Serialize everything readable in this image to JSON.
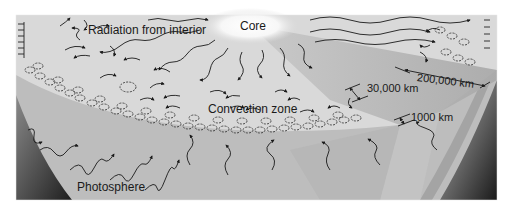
{
  "figure": {
    "labels": {
      "core": "Core",
      "radiation": "Radiation from interior",
      "convection": "Convection zone",
      "photosphere": "Photosphere"
    },
    "dimensions": {
      "radiative_depth": "200,000 km",
      "convection_depth": "30,000 km",
      "photosphere_depth": "1000 km"
    },
    "colors": {
      "background": "#ffffff",
      "interior_light": "#dcdcdc",
      "core_glow": "#f7f7f7",
      "wedge_mid": "#b9b9b9",
      "photosphere": "#a9a9a9",
      "edge_dark": "#3a3a3a",
      "ink": "#1a1a1a"
    }
  }
}
